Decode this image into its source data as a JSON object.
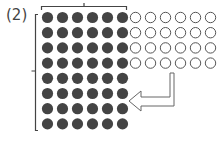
{
  "figure": {
    "label": "(2)",
    "colors": {
      "filled_dot": "#444444",
      "open_dot_stroke": "#555555",
      "bracket": "#444444",
      "arrow_stroke": "#666666"
    },
    "filled_grid": {
      "rows": 8,
      "cols": 6
    },
    "open_grid": {
      "rows": 4,
      "cols": 6
    },
    "arrow": {
      "direction": "down-then-left",
      "style": "outlined"
    },
    "brackets": [
      "top",
      "left"
    ]
  }
}
